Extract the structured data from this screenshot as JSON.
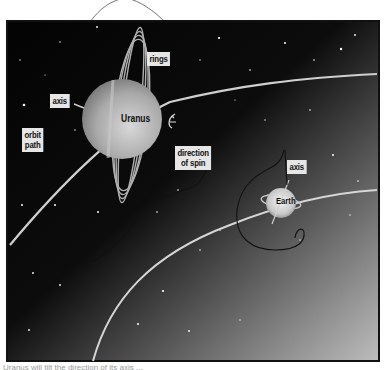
{
  "figure": {
    "colors": {
      "space_dark": "#050505",
      "space_light": "#b5b5b5",
      "orbit_line": "#d0d0d0",
      "label_bg": "#e6e6e6",
      "pen_ink": "#111111"
    }
  },
  "labels": {
    "rings": "rings",
    "axis_uranus": "axis",
    "orbit_path_line1": "orbit",
    "orbit_path_line2": "path",
    "uranus": "Uranus",
    "direction_line1": "direction",
    "direction_line2": "of spin",
    "axis_earth": "axis",
    "earth": "Earth"
  },
  "caption": {
    "text": "Uranus will tilt the direction of its axis ..."
  }
}
